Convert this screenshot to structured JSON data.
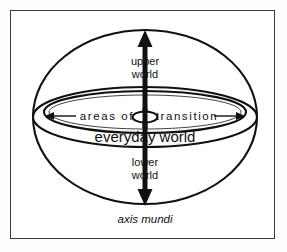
{
  "figure": {
    "background_color": "#ffffff",
    "frame_color": "#3a3a3a",
    "ink_color": "#111111"
  },
  "labels": {
    "upper_world_line1": "upper",
    "upper_world_line2": "world",
    "lower_world_line1": "lower",
    "lower_world_line2": "world",
    "areas_of": "areas of",
    "transition": "transition",
    "everyday_world": "everyday world",
    "axis_mundi": "axis mundi"
  },
  "geometry": {
    "sphere": {
      "cx": 145,
      "cy": 117,
      "rx": 112,
      "ry": 87
    },
    "disk_outer": {
      "cx": 145,
      "cy": 117,
      "rx": 112,
      "ry": 30
    },
    "disk_inner": {
      "cx": 145,
      "cy": 113,
      "rx": 101,
      "ry": 21
    },
    "hub": {
      "cx": 145,
      "cy": 117,
      "rx": 12,
      "ry": 5
    },
    "axis": {
      "x": 145,
      "top": 32,
      "bottom": 204,
      "width": 5
    }
  }
}
